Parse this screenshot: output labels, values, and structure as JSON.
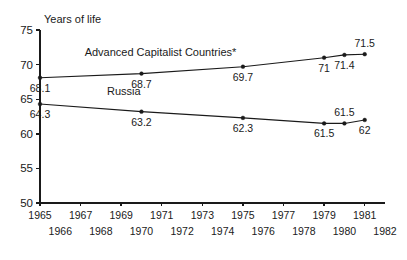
{
  "chart_data": {
    "type": "line",
    "title": "",
    "ylabel": "Years of life",
    "xlabel": "",
    "ylim": [
      50,
      75
    ],
    "xlim": [
      1965,
      1982
    ],
    "grid": false,
    "legend": "inline-labels",
    "y_ticks": [
      "75",
      "70",
      "65",
      "60",
      "55",
      "50"
    ],
    "y_tick_values": [
      75,
      70,
      65,
      60,
      55,
      50
    ],
    "x_ticks_top": [
      "1965",
      "1967",
      "1969",
      "1971",
      "1973",
      "1975",
      "1977",
      "1979",
      "1981"
    ],
    "x_ticks_top_values": [
      1965,
      1967,
      1969,
      1971,
      1973,
      1975,
      1977,
      1979,
      1981
    ],
    "x_ticks_bottom": [
      "1966",
      "1968",
      "1970",
      "1972",
      "1974",
      "1976",
      "1978",
      "1980",
      "1982"
    ],
    "x_ticks_bottom_values": [
      1966,
      1968,
      1970,
      1972,
      1974,
      1976,
      1978,
      1980,
      1982
    ],
    "series": [
      {
        "name": "Advanced Capitalist Countries*",
        "label_x": 1967.2,
        "label_y": 71.3,
        "x": [
          1965,
          1970,
          1975,
          1979,
          1980,
          1981
        ],
        "values": [
          68.1,
          68.7,
          69.7,
          71,
          71.4,
          71.5
        ],
        "point_labels": [
          "68.1",
          "68.7",
          "69.7",
          "71",
          "71.4",
          "71.5"
        ],
        "point_label_side": [
          "below",
          "below",
          "below",
          "below",
          "below",
          "above"
        ]
      },
      {
        "name": "Russia",
        "label_x": 1968.3,
        "label_y": 65.6,
        "x": [
          1965,
          1970,
          1975,
          1979,
          1980,
          1981
        ],
        "values": [
          64.3,
          63.2,
          62.3,
          61.5,
          61.5,
          62
        ],
        "point_labels": [
          "64.3",
          "63.2",
          "62.3",
          "61.5",
          "61.5",
          "62"
        ],
        "point_label_side": [
          "below",
          "below",
          "below",
          "below",
          "above",
          "below"
        ]
      }
    ]
  },
  "colors": {
    "ink": "#1a1a1a",
    "background": "#ffffff"
  }
}
